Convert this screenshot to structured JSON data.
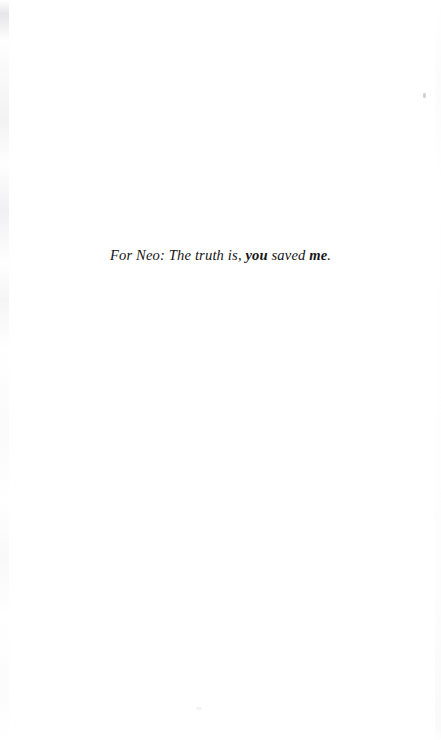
{
  "page": {
    "kind": "book-dedication-page",
    "background_color": "#ffffff",
    "ink_color": "#151515",
    "width": 441,
    "height": 740
  },
  "dedication": {
    "segments": [
      {
        "text": "For Neo: The truth is, ",
        "emphasis": false
      },
      {
        "text": "you",
        "emphasis": true
      },
      {
        "text": " saved ",
        "emphasis": false
      },
      {
        "text": "me",
        "emphasis": true
      },
      {
        "text": ".",
        "emphasis": false
      }
    ],
    "part_1": "For Neo: The truth is, ",
    "emphasis_1": "you",
    "part_2": " saved ",
    "emphasis_2": "me",
    "part_3": "."
  },
  "artifacts": {
    "gutter_shadow_side": "left",
    "speck_label": "scan-speck"
  }
}
